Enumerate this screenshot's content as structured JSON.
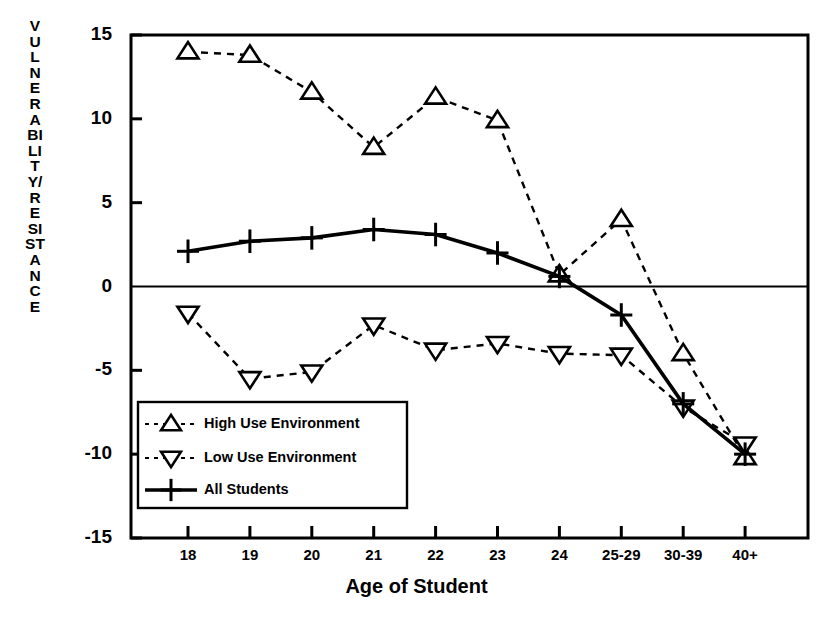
{
  "chart_data": {
    "type": "line",
    "title": "",
    "xlabel": "Age of Student",
    "ylabel": "VULNERABILITY/RESISTANCE",
    "categories": [
      "18",
      "19",
      "20",
      "21",
      "22",
      "23",
      "24",
      "25-29",
      "30-39",
      "40+"
    ],
    "ylim": [
      -15,
      15
    ],
    "yticks": [
      15,
      10,
      5,
      0,
      -5,
      -10,
      -15
    ],
    "ytick_labels": [
      "15",
      "10",
      "5",
      "0",
      "-5",
      "-10",
      "-15"
    ],
    "grid": false,
    "zero_line": true,
    "legend_position": "lower-left-inside",
    "series": [
      {
        "name": "High Use Environment",
        "marker": "triangle-up",
        "linestyle": "dashed",
        "color": "#000000",
        "values": [
          14.0,
          13.8,
          11.6,
          8.3,
          11.3,
          9.9,
          0.7,
          4.0,
          -4.0,
          -10.2
        ]
      },
      {
        "name": "Low Use Environment",
        "marker": "triangle-down",
        "linestyle": "dashed",
        "color": "#000000",
        "values": [
          -1.6,
          -5.5,
          -5.1,
          -2.3,
          -3.8,
          -3.4,
          -4.0,
          -4.1,
          -7.2,
          -9.4
        ]
      },
      {
        "name": "All Students",
        "marker": "plus",
        "linestyle": "solid",
        "color": "#000000",
        "values": [
          2.1,
          2.7,
          2.9,
          3.4,
          3.1,
          2.0,
          0.6,
          -1.7,
          -7.0,
          -10.0
        ]
      }
    ]
  },
  "legend": {
    "entries": [
      {
        "label": "High Use Environment"
      },
      {
        "label": "Low Use Environment"
      },
      {
        "label": "All Students"
      }
    ]
  }
}
